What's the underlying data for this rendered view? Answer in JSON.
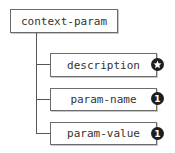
{
  "diagram": {
    "root": {
      "label": "context-param"
    },
    "children": [
      {
        "label": "description",
        "cardinality": "*",
        "badge_icon": "star-icon"
      },
      {
        "label": "param-name",
        "cardinality": "1",
        "badge_icon": "one-icon"
      },
      {
        "label": "param-value",
        "cardinality": "1",
        "badge_icon": "one-icon"
      }
    ],
    "colors": {
      "border": "#6b6b6b",
      "line": "#555555",
      "badge": "#1e1e1e"
    }
  }
}
